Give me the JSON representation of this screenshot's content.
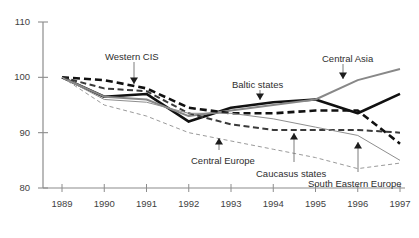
{
  "chart_data": {
    "type": "line",
    "title": "",
    "xlabel": "",
    "ylabel": "",
    "x": [
      1989,
      1990,
      1991,
      1992,
      1993,
      1994,
      1995,
      1996,
      1997
    ],
    "xtick_labels": [
      "1989",
      "1990",
      "1991",
      "1992",
      "1993",
      "1994",
      "1995",
      "1996",
      "1997"
    ],
    "ytick_labels": [
      "80",
      "90",
      "100",
      "110"
    ],
    "yticks": [
      80,
      90,
      100,
      110
    ],
    "ylim": [
      80,
      110
    ],
    "xlim": [
      1989,
      1997
    ],
    "grid": false,
    "legend": "annotations-with-arrows",
    "index_base": "1989 = 100",
    "series": [
      {
        "name": "Baltic states",
        "style": "solid",
        "color": "#111111",
        "width": 2.6,
        "values": [
          100,
          96.5,
          97,
          92,
          94.5,
          95.5,
          96,
          93.5,
          97
        ]
      },
      {
        "name": "Central Asia",
        "style": "solid",
        "color": "#888888",
        "width": 2.0,
        "values": [
          100,
          96.5,
          96,
          93,
          94,
          95,
          96,
          99.5,
          101.5
        ]
      },
      {
        "name": "Western CIS",
        "style": "dashed",
        "color": "#111111",
        "width": 2.6,
        "values": [
          100,
          99.5,
          98,
          94.5,
          93.5,
          93.5,
          94,
          94,
          88
        ]
      },
      {
        "name": "Caucasus states",
        "style": "dashed",
        "color": "#3a3a3a",
        "width": 2.0,
        "values": [
          100,
          98,
          97.5,
          93.5,
          91.5,
          90.5,
          90.5,
          90.5,
          90
        ]
      },
      {
        "name": "South Eastern Europe",
        "style": "solid",
        "color": "#8e8e8e",
        "width": 1.0,
        "values": [
          100,
          96,
          95.5,
          93.5,
          93.5,
          92.5,
          91,
          89.5,
          85
        ]
      },
      {
        "name": "Central Europe",
        "style": "dashed",
        "color": "#9a9a9a",
        "width": 1.0,
        "values": [
          100,
          95,
          93,
          90,
          88.5,
          87,
          85.5,
          83.5,
          84.5
        ]
      }
    ],
    "annotations": [
      {
        "text": "Western CIS",
        "target_series": "Western CIS",
        "arrow": "down"
      },
      {
        "text": "Baltic states",
        "target_series": "Baltic states",
        "arrow": "down"
      },
      {
        "text": "Central Asia",
        "target_series": "Central Asia",
        "arrow": "down"
      },
      {
        "text": "Central Europe",
        "target_series": "Central Europe",
        "arrow": "up"
      },
      {
        "text": "Caucasus states",
        "target_series": "Caucasus states",
        "arrow": "up"
      },
      {
        "text": "South Eastern Europe",
        "target_series": "South Eastern Europe",
        "arrow": "up"
      }
    ]
  },
  "axis": {
    "y_labels": [
      {
        "text": "110",
        "value": 110
      },
      {
        "text": "100",
        "value": 100
      },
      {
        "text": "90",
        "value": 90
      },
      {
        "text": "80",
        "value": 80
      }
    ],
    "x_labels": [
      {
        "text": "1989"
      },
      {
        "text": "1990"
      },
      {
        "text": "1991"
      },
      {
        "text": "1992"
      },
      {
        "text": "1993"
      },
      {
        "text": "1994"
      },
      {
        "text": "1995"
      },
      {
        "text": "1996"
      },
      {
        "text": "1997"
      }
    ],
    "axis_color": "#8c8c8c"
  },
  "colors": {
    "background": "#ffffff",
    "axis": "#8c8c8c",
    "text": "#3a3a3a",
    "series_dark": "#111111",
    "series_mid": "#3a3a3a",
    "series_gray": "#888888",
    "series_light": "#9a9a9a"
  }
}
